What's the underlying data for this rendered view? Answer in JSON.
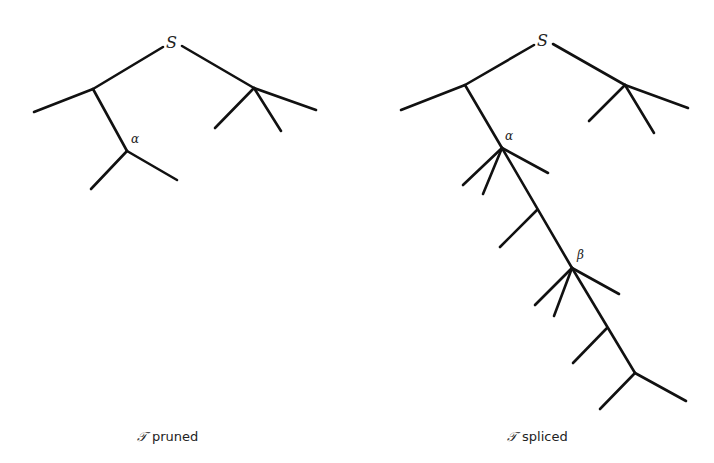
{
  "figure": {
    "left": {
      "root_label": "S",
      "node_alpha_label": "α",
      "caption_symbol": "𝒯",
      "caption_text": "pruned"
    },
    "right": {
      "root_label": "S",
      "node_alpha_label": "α",
      "node_beta_label": "β",
      "caption_symbol": "𝒯",
      "caption_text": "spliced"
    },
    "line_color": "#111111"
  }
}
